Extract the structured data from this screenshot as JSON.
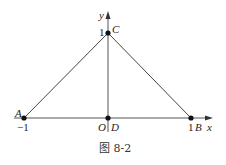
{
  "figure": {
    "caption": "图 8-2",
    "axes": {
      "x_label": "x",
      "y_label": "y"
    },
    "ticks": {
      "x_neg": "−1",
      "x_pos": "1",
      "y_pos": "1"
    },
    "points": {
      "A": {
        "label": "A",
        "coords": [
          -1,
          0
        ]
      },
      "B": {
        "label": "B",
        "coords": [
          1,
          0
        ]
      },
      "C": {
        "label": "C",
        "coords": [
          0,
          1
        ]
      },
      "O": {
        "label": "O",
        "coords": [
          0,
          0
        ]
      },
      "D": {
        "label": "D",
        "coords": [
          0,
          0
        ]
      }
    },
    "segments": [
      "AC",
      "CB",
      "CD",
      "AB"
    ],
    "colors": {
      "line": "#444444",
      "point": "#111111"
    }
  }
}
